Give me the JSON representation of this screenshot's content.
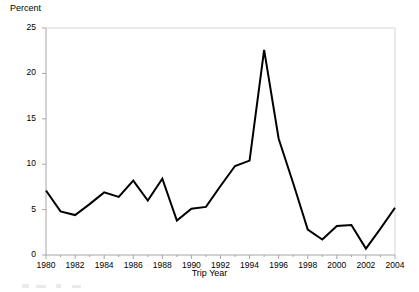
{
  "chart_data": {
    "type": "line",
    "title": "",
    "xlabel": "Trip Year",
    "ylabel": "Percent",
    "xlim": [
      1980,
      2004
    ],
    "ylim": [
      0,
      25
    ],
    "grid": false,
    "legend": "none",
    "yticks": [
      "0",
      "5",
      "10",
      "15",
      "20",
      "25"
    ],
    "ytick_values": [
      0,
      5,
      10,
      15,
      20,
      25
    ],
    "xticks": [
      "1980",
      "1982",
      "1984",
      "1986",
      "1988",
      "1990",
      "1992",
      "1994",
      "1996",
      "1998",
      "2000",
      "2002",
      "2004"
    ],
    "xtick_values": [
      1980,
      1982,
      1984,
      1986,
      1988,
      1990,
      1992,
      1994,
      1996,
      1998,
      2000,
      2002,
      2004
    ],
    "x": [
      1980,
      1981,
      1982,
      1983,
      1984,
      1985,
      1986,
      1987,
      1988,
      1989,
      1990,
      1991,
      1992,
      1993,
      1994,
      1995,
      1996,
      1997,
      1998,
      1999,
      2000,
      2001,
      2002,
      2003,
      2004
    ],
    "values": [
      7.1,
      4.8,
      4.4,
      5.6,
      6.9,
      6.4,
      8.2,
      6.0,
      8.4,
      3.8,
      5.1,
      5.3,
      7.6,
      9.8,
      10.4,
      22.6,
      12.8,
      7.9,
      2.8,
      1.7,
      3.2,
      3.3,
      0.7,
      2.9,
      5.2
    ],
    "series": [
      {
        "name": "Percent",
        "color": "#000000",
        "values": [
          7.1,
          4.8,
          4.4,
          5.6,
          6.9,
          6.4,
          8.2,
          6.0,
          8.4,
          3.8,
          5.1,
          5.3,
          7.6,
          9.8,
          10.4,
          22.6,
          12.8,
          7.9,
          2.8,
          1.7,
          3.2,
          3.3,
          0.7,
          2.9,
          5.2
        ]
      }
    ]
  },
  "axes": {
    "y_title": "Percent",
    "x_title": "Trip Year"
  },
  "style": {
    "line_color": "#000000",
    "axis_color": "#a6a6a6",
    "background": "#ffffff"
  }
}
